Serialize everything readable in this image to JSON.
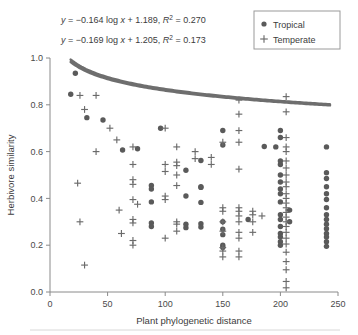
{
  "figure": {
    "width": 358,
    "height": 335,
    "background": "#ffffff"
  },
  "annotations": {
    "equation_tropical": "y = −0.164 log x + 1.189, R² = 0.270",
    "equation_temperate": "y = −0.169 log x + 1.205, R² = 0.173",
    "eq1_parts": {
      "y": "y",
      "body": " = −0.164 log ",
      "x": "x",
      "mid": " + 1.189, ",
      "r": "R",
      "sup": "2",
      "tail": " = 0.270"
    },
    "eq2_parts": {
      "y": "y",
      "body": " = −0.169 log ",
      "x": "x",
      "mid": " + 1.205, ",
      "r": "R",
      "sup": "2",
      "tail": " = 0.173"
    }
  },
  "legend": {
    "position": "top-right",
    "items": [
      {
        "label": "Tropical",
        "marker": "circle",
        "color": "#5a5a5a"
      },
      {
        "label": "Temperate",
        "marker": "plus",
        "color": "#6b6b6b"
      }
    ]
  },
  "chart_data": {
    "type": "scatter",
    "title": "",
    "xlabel": "Plant phylogenetic distance",
    "ylabel": "Herbivore similarity",
    "xlim": [
      0,
      250
    ],
    "ylim": [
      0.0,
      1.0
    ],
    "xticks": [
      0,
      50,
      100,
      150,
      200,
      250
    ],
    "xtick_labels": [
      "0",
      "50",
      "100",
      "150",
      "200",
      "250"
    ],
    "yticks": [
      0.0,
      0.2,
      0.4,
      0.6,
      0.8,
      1.0
    ],
    "ytick_labels": [
      "0.0",
      "0.2",
      "0.4",
      "0.6",
      "0.8",
      "1.0"
    ],
    "grid": false,
    "legend_position": "top-right",
    "series": [
      {
        "name": "Tropical",
        "marker": "circle",
        "color": "#5a5a5a",
        "fit": {
          "equation": "y = -0.164 log x + 1.189",
          "slope": -0.164,
          "intercept": 1.189,
          "r2": 0.27,
          "type": "logarithmic",
          "x_start": 18,
          "x_end": 243
        },
        "points": [
          [
            22,
            0.935
          ],
          [
            18,
            0.845
          ],
          [
            32,
            0.745
          ],
          [
            46,
            0.735
          ],
          [
            63,
            0.607
          ],
          [
            96,
            0.7
          ],
          [
            76,
            0.612
          ],
          [
            88,
            0.455
          ],
          [
            88,
            0.44
          ],
          [
            88,
            0.385
          ],
          [
            88,
            0.295
          ],
          [
            88,
            0.28
          ],
          [
            131,
            0.562
          ],
          [
            131,
            0.45
          ],
          [
            131,
            0.447
          ],
          [
            131,
            0.383
          ],
          [
            131,
            0.292
          ],
          [
            131,
            0.278
          ],
          [
            150,
            0.69
          ],
          [
            150,
            0.628
          ],
          [
            150,
            0.3
          ],
          [
            150,
            0.268
          ],
          [
            150,
            0.245
          ],
          [
            150,
            0.2
          ],
          [
            150,
            0.19
          ],
          [
            172,
            0.31
          ],
          [
            186,
            0.622
          ],
          [
            196,
            0.62
          ],
          [
            200,
            0.69
          ],
          [
            200,
            0.66
          ],
          [
            200,
            0.56
          ],
          [
            200,
            0.545
          ],
          [
            200,
            0.5
          ],
          [
            200,
            0.47
          ],
          [
            200,
            0.44
          ],
          [
            200,
            0.42
          ],
          [
            200,
            0.385
          ],
          [
            200,
            0.33
          ],
          [
            200,
            0.31
          ],
          [
            200,
            0.28
          ],
          [
            200,
            0.25
          ],
          [
            200,
            0.235
          ],
          [
            200,
            0.215
          ],
          [
            200,
            0.2
          ],
          [
            208,
            0.35
          ],
          [
            208,
            0.3
          ],
          [
            240,
            0.62
          ],
          [
            240,
            0.51
          ],
          [
            240,
            0.485
          ],
          [
            240,
            0.45
          ],
          [
            240,
            0.42
          ],
          [
            240,
            0.395
          ],
          [
            240,
            0.36
          ],
          [
            240,
            0.33
          ],
          [
            240,
            0.31
          ],
          [
            240,
            0.29
          ],
          [
            240,
            0.27
          ],
          [
            240,
            0.25
          ],
          [
            240,
            0.235
          ],
          [
            240,
            0.215
          ],
          [
            240,
            0.195
          ],
          [
            118,
            0.52
          ],
          [
            118,
            0.41
          ],
          [
            118,
            0.29
          ],
          [
            118,
            0.275
          ]
        ]
      },
      {
        "name": "Temperate",
        "marker": "plus",
        "color": "#6b6b6b",
        "fit": {
          "equation": "y = -0.169 log x + 1.205",
          "slope": -0.169,
          "intercept": 1.205,
          "r2": 0.173,
          "type": "logarithmic",
          "x_start": 18,
          "x_end": 243
        },
        "points": [
          [
            26,
            0.84
          ],
          [
            40,
            0.84
          ],
          [
            30,
            0.78
          ],
          [
            52,
            0.7
          ],
          [
            58,
            0.65
          ],
          [
            40,
            0.6
          ],
          [
            24,
            0.465
          ],
          [
            26,
            0.3
          ],
          [
            30,
            0.115
          ],
          [
            72,
            0.62
          ],
          [
            72,
            0.545
          ],
          [
            72,
            0.48
          ],
          [
            72,
            0.46
          ],
          [
            72,
            0.395
          ],
          [
            72,
            0.31
          ],
          [
            72,
            0.295
          ],
          [
            72,
            0.22
          ],
          [
            72,
            0.2
          ],
          [
            76,
            0.375
          ],
          [
            60,
            0.35
          ],
          [
            62,
            0.25
          ],
          [
            100,
            0.7
          ],
          [
            100,
            0.545
          ],
          [
            100,
            0.515
          ],
          [
            100,
            0.41
          ],
          [
            100,
            0.395
          ],
          [
            100,
            0.23
          ],
          [
            110,
            0.62
          ],
          [
            110,
            0.555
          ],
          [
            110,
            0.54
          ],
          [
            110,
            0.5
          ],
          [
            110,
            0.455
          ],
          [
            110,
            0.3
          ],
          [
            110,
            0.29
          ],
          [
            110,
            0.26
          ],
          [
            126,
            0.6
          ],
          [
            126,
            0.57
          ],
          [
            150,
            0.64
          ],
          [
            150,
            0.36
          ],
          [
            150,
            0.345
          ],
          [
            150,
            0.3
          ],
          [
            150,
            0.26
          ],
          [
            150,
            0.19
          ],
          [
            150,
            0.175
          ],
          [
            150,
            0.15
          ],
          [
            164,
            0.82
          ],
          [
            164,
            0.76
          ],
          [
            164,
            0.69
          ],
          [
            164,
            0.64
          ],
          [
            164,
            0.525
          ],
          [
            164,
            0.36
          ],
          [
            164,
            0.345
          ],
          [
            164,
            0.325
          ],
          [
            164,
            0.3
          ],
          [
            164,
            0.255
          ],
          [
            164,
            0.23
          ],
          [
            164,
            0.175
          ],
          [
            164,
            0.15
          ],
          [
            176,
            0.345
          ],
          [
            176,
            0.33
          ],
          [
            176,
            0.3
          ],
          [
            176,
            0.255
          ],
          [
            184,
            0.325
          ],
          [
            205,
            0.835
          ],
          [
            205,
            0.77
          ],
          [
            205,
            0.66
          ],
          [
            205,
            0.62
          ],
          [
            205,
            0.6
          ],
          [
            205,
            0.56
          ],
          [
            205,
            0.53
          ],
          [
            205,
            0.5
          ],
          [
            205,
            0.47
          ],
          [
            205,
            0.45
          ],
          [
            205,
            0.42
          ],
          [
            205,
            0.4
          ],
          [
            205,
            0.38
          ],
          [
            205,
            0.36
          ],
          [
            205,
            0.34
          ],
          [
            205,
            0.32
          ],
          [
            205,
            0.3
          ],
          [
            205,
            0.28
          ],
          [
            205,
            0.255
          ],
          [
            205,
            0.23
          ],
          [
            205,
            0.205
          ],
          [
            205,
            0.17
          ],
          [
            205,
            0.13
          ],
          [
            205,
            0.095
          ],
          [
            205,
            0.045
          ],
          [
            205,
            0.018
          ],
          [
            140,
            0.575
          ],
          [
            140,
            0.545
          ]
        ]
      }
    ]
  }
}
